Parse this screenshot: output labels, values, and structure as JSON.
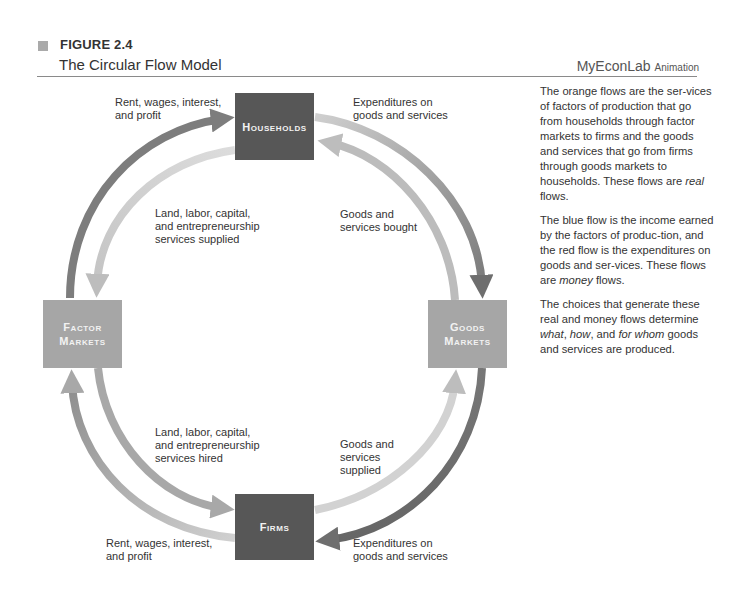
{
  "header": {
    "figure_label": "FIGURE 2.4",
    "title": "The Circular Flow Model",
    "brand": "MyEconLab",
    "brand_sub": "Animation"
  },
  "nodes": {
    "households": "Households",
    "factor_markets_line1": "Factor",
    "factor_markets_line2": "Markets",
    "goods_markets_line1": "Goods",
    "goods_markets_line2": "Markets",
    "firms": "Firms"
  },
  "flow_labels": {
    "top_left": "Rent, wages, interest,\nand profit",
    "top_right": "Expenditures on\ngoods and services",
    "inner_upper_left": "Land, labor, capital,\nand entrepreneurship\nservices supplied",
    "inner_upper_right": "Goods and\nservices bought",
    "inner_lower_left": "Land, labor, capital,\nand entrepreneurship\nservices hired",
    "inner_lower_right": "Goods and\nservices\nsupplied",
    "bottom_left": "Rent, wages, interest,\nand profit",
    "bottom_right": "Expenditures on\ngoods and services"
  },
  "description": {
    "p1_a": "The orange flows are the ser-vices of factors of production that go from households through factor markets to firms and the goods and services that go from firms through goods markets to households. These flows are ",
    "p1_em": "real",
    "p1_b": " flows.",
    "p2_a": "The blue flow is the income earned by the factors of produc-tion, and the red flow is the expenditures on goods and ser-vices. These flows are ",
    "p2_em": "money",
    "p2_b": " flows.",
    "p3_a": "The choices that generate these real and money flows determine ",
    "p3_em1": "what",
    "p3_c1": ", ",
    "p3_em2": "how",
    "p3_c2": ", and ",
    "p3_em3": "for whom",
    "p3_b": " goods and services are produced."
  },
  "colors": {
    "households_box": "#575757",
    "firms_box": "#575757",
    "markets_box": "#a6a6a6",
    "income_flow": "#7d7d7d",
    "expenditure_flow": "#6e6e6e",
    "real_flow": "#c6c6c6"
  }
}
